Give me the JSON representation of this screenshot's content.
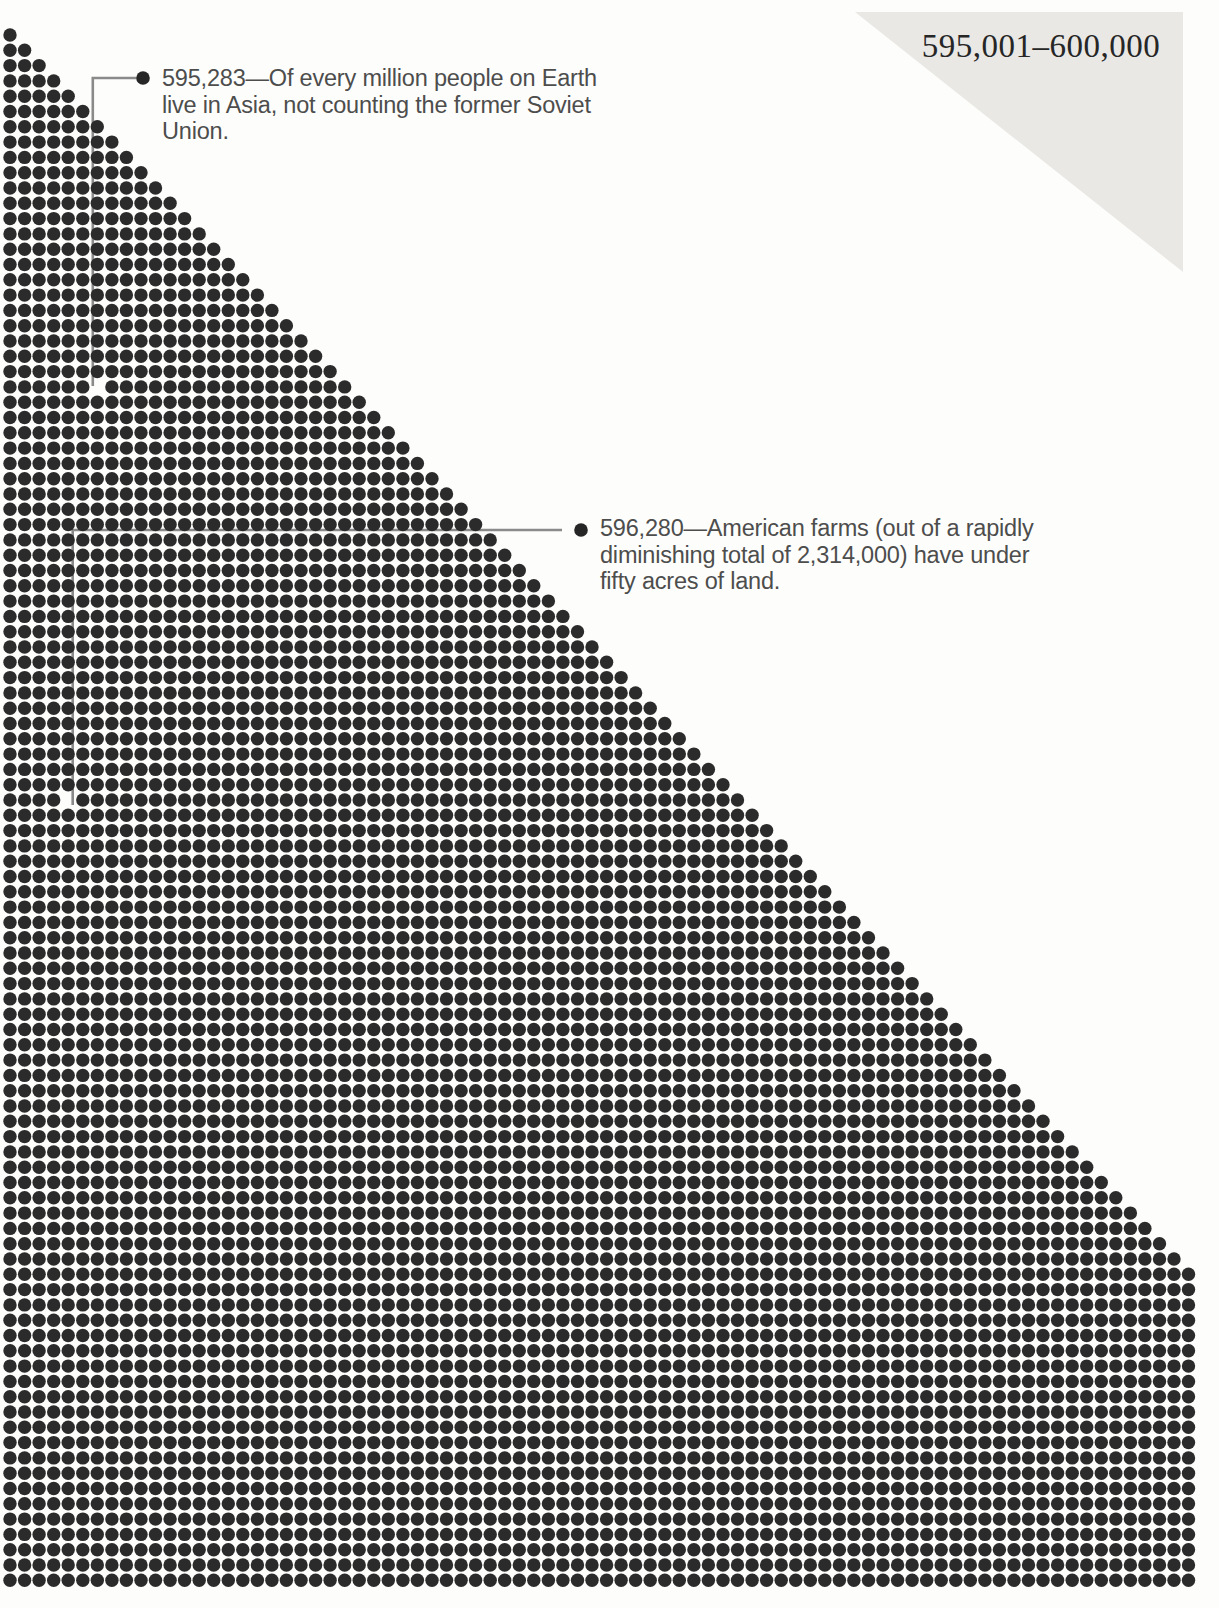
{
  "page": {
    "header_range": "595,001–600,000",
    "background": "#fdfdfb",
    "corner_triangle_color": "#e9e8e5",
    "header_color": "#262626"
  },
  "dot_field": {
    "page_start_value": 595001,
    "page_end_value": 600000,
    "origin_x": 10,
    "origin_y": 35,
    "dx": 14.55,
    "dy": 15.3,
    "rows": 102,
    "max_cols": 82,
    "dot_radius": 6.7,
    "dot_color": "#2b2b2b"
  },
  "annotations": [
    {
      "value": 595283,
      "label": "595,283",
      "lines": [
        "595,283—Of every million people on Earth",
        "live in Asia, not counting the former Soviet",
        "Union."
      ],
      "bullet_x": 143,
      "bullet_y": 78,
      "text_x": 162,
      "first_baseline_y": 86,
      "leader": [
        [
          136.5,
          78
        ],
        [
          92.8,
          78
        ],
        [
          92.8,
          386
        ]
      ]
    },
    {
      "value": 596280,
      "label": "596,280",
      "lines": [
        "596,280—American farms (out of a rapidly",
        "diminishing total of 2,314,000) have under",
        "fifty acres of land."
      ],
      "bullet_x": 581,
      "bullet_y": 530,
      "text_x": 600,
      "first_baseline_y": 536,
      "leader": [
        [
          562,
          530
        ],
        [
          72.7,
          530
        ],
        [
          72.7,
          805
        ]
      ]
    }
  ],
  "styles": {
    "annotation_text_color": "#4d4d4d",
    "leader_color": "#8a8a8a",
    "leader_width": 2.6,
    "bullet_color": "#262626",
    "bullet_radius": 6.8,
    "line_height": 26.7
  }
}
